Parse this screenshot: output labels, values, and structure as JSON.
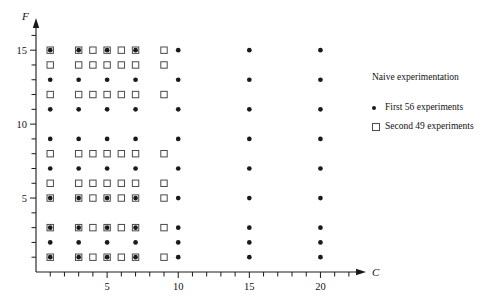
{
  "chart_data": {
    "type": "scatter",
    "title": "",
    "xlabel": "C",
    "ylabel": "F",
    "xlim": [
      0,
      22.5
    ],
    "ylim": [
      0,
      16.5
    ],
    "grid": false,
    "xticks_labeled": [
      5,
      10,
      15,
      20
    ],
    "yticks_labeled": [
      5,
      10,
      15
    ],
    "xtick_step_minor": 1,
    "ytick_step_minor": 1,
    "legend_position": "right",
    "legend_title": "Naive experimentation",
    "series": [
      {
        "name": "First 56 experiments",
        "marker": "filled-circle",
        "color": "#1a1a1a",
        "count": 56,
        "points": [
          [
            1,
            1
          ],
          [
            3,
            1
          ],
          [
            5,
            1
          ],
          [
            7,
            1
          ],
          [
            10,
            1
          ],
          [
            15,
            1
          ],
          [
            20,
            1
          ],
          [
            1,
            2
          ],
          [
            3,
            2
          ],
          [
            5,
            2
          ],
          [
            7,
            2
          ],
          [
            10,
            2
          ],
          [
            15,
            2
          ],
          [
            20,
            2
          ],
          [
            1,
            3
          ],
          [
            3,
            3
          ],
          [
            5,
            3
          ],
          [
            7,
            3
          ],
          [
            10,
            3
          ],
          [
            15,
            3
          ],
          [
            20,
            3
          ],
          [
            1,
            5
          ],
          [
            3,
            5
          ],
          [
            5,
            5
          ],
          [
            7,
            5
          ],
          [
            10,
            5
          ],
          [
            15,
            5
          ],
          [
            20,
            5
          ],
          [
            1,
            7
          ],
          [
            3,
            7
          ],
          [
            5,
            7
          ],
          [
            7,
            7
          ],
          [
            10,
            7
          ],
          [
            15,
            7
          ],
          [
            20,
            7
          ],
          [
            1,
            9
          ],
          [
            3,
            9
          ],
          [
            5,
            9
          ],
          [
            7,
            9
          ],
          [
            10,
            9
          ],
          [
            15,
            9
          ],
          [
            20,
            9
          ],
          [
            1,
            11
          ],
          [
            3,
            11
          ],
          [
            5,
            11
          ],
          [
            7,
            11
          ],
          [
            10,
            11
          ],
          [
            15,
            11
          ],
          [
            20,
            11
          ],
          [
            1,
            13
          ],
          [
            3,
            13
          ],
          [
            5,
            13
          ],
          [
            7,
            13
          ],
          [
            10,
            13
          ],
          [
            15,
            13
          ],
          [
            20,
            13
          ],
          [
            1,
            15
          ],
          [
            3,
            15
          ],
          [
            5,
            15
          ],
          [
            7,
            15
          ],
          [
            10,
            15
          ],
          [
            15,
            15
          ],
          [
            20,
            15
          ]
        ]
      },
      {
        "name": "Second 49 experiments",
        "marker": "open-square",
        "color": "#4a4a4a",
        "count": 49,
        "points": [
          [
            1,
            1
          ],
          [
            3,
            1
          ],
          [
            4,
            1
          ],
          [
            5,
            1
          ],
          [
            6,
            1
          ],
          [
            7,
            1
          ],
          [
            9,
            1
          ],
          [
            1,
            3
          ],
          [
            3,
            3
          ],
          [
            4,
            3
          ],
          [
            5,
            3
          ],
          [
            6,
            3
          ],
          [
            7,
            3
          ],
          [
            9,
            3
          ],
          [
            1,
            5
          ],
          [
            3,
            5
          ],
          [
            4,
            5
          ],
          [
            5,
            5
          ],
          [
            6,
            5
          ],
          [
            7,
            5
          ],
          [
            9,
            5
          ],
          [
            1,
            6
          ],
          [
            3,
            6
          ],
          [
            4,
            6
          ],
          [
            5,
            6
          ],
          [
            6,
            6
          ],
          [
            7,
            6
          ],
          [
            9,
            6
          ],
          [
            1,
            8
          ],
          [
            3,
            8
          ],
          [
            4,
            8
          ],
          [
            5,
            8
          ],
          [
            6,
            8
          ],
          [
            7,
            8
          ],
          [
            9,
            8
          ],
          [
            1,
            12
          ],
          [
            3,
            12
          ],
          [
            4,
            12
          ],
          [
            5,
            12
          ],
          [
            6,
            12
          ],
          [
            7,
            12
          ],
          [
            9,
            12
          ],
          [
            1,
            14
          ],
          [
            3,
            14
          ],
          [
            4,
            14
          ],
          [
            5,
            14
          ],
          [
            6,
            14
          ],
          [
            7,
            14
          ],
          [
            9,
            14
          ],
          [
            1,
            15
          ],
          [
            4,
            15
          ],
          [
            6,
            15
          ],
          [
            9,
            15
          ],
          [
            3,
            15
          ],
          [
            5,
            15
          ],
          [
            7,
            15
          ]
        ]
      }
    ]
  },
  "axes": {
    "x_axis_label": "C",
    "y_axis_label": "F",
    "x_tick_labels": [
      "5",
      "10",
      "15",
      "20"
    ],
    "y_tick_labels": [
      "5",
      "10",
      "15"
    ]
  },
  "legend": {
    "title": "Naive experimentation",
    "entries": [
      {
        "label": "First 56 experiments",
        "marker": "filled-circle-icon"
      },
      {
        "label": "Second 49 experiments",
        "marker": "open-square-icon"
      }
    ]
  }
}
